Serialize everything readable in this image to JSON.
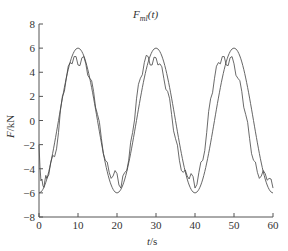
{
  "chart_data": {
    "type": "line",
    "title_main": "F",
    "title_sub": "ml",
    "title_arg": "(t)",
    "xlabel": "t/s",
    "xlabel_var": "t",
    "xlabel_unit": "/s",
    "ylabel": "F/kN",
    "ylabel_var": "F",
    "ylabel_unit": "/kN",
    "xlim": [
      0,
      60
    ],
    "ylim": [
      -8,
      8
    ],
    "xticks": [
      0,
      10,
      20,
      30,
      40,
      50,
      60
    ],
    "yticks": [
      -8,
      -6,
      -4,
      -2,
      0,
      2,
      4,
      6,
      8
    ],
    "grid": false,
    "legend": "none",
    "series": [
      {
        "name": "theoretical (smooth sine)",
        "amplitude": 6,
        "period": 20,
        "x": [
          0,
          2.5,
          5,
          7.5,
          10,
          12.5,
          15,
          17.5,
          20,
          22.5,
          25,
          27.5,
          30,
          32.5,
          35,
          37.5,
          40,
          42.5,
          45,
          47.5,
          50,
          52.5,
          55,
          57.5,
          60
        ],
        "values": [
          -6,
          -4.2,
          0,
          4.2,
          6,
          4.2,
          0,
          -4.2,
          -6,
          -4.2,
          0,
          4.2,
          6,
          4.2,
          0,
          -4.2,
          -6,
          -4.2,
          0,
          4.2,
          6,
          4.2,
          0,
          -4.2,
          -6
        ]
      },
      {
        "name": "measured (noisy)",
        "x": [
          0,
          0.5,
          1,
          1.5,
          2,
          3,
          4,
          5,
          6,
          7,
          8,
          9,
          10,
          11,
          12,
          13,
          14,
          15,
          16,
          17,
          18,
          19,
          20,
          21,
          22,
          23,
          24,
          25,
          26,
          27,
          28,
          29,
          30,
          31,
          32,
          33,
          34,
          35,
          36,
          37,
          38,
          39,
          40,
          41,
          42,
          43,
          44,
          45,
          46,
          47,
          48,
          49,
          50,
          51,
          52,
          53,
          54,
          55,
          56,
          57,
          58,
          59,
          60
        ],
        "values": [
          -2,
          -5,
          -5.4,
          -5.0,
          -4.8,
          -3.5,
          -3.0,
          -1.0,
          2.0,
          3.5,
          4.8,
          5.3,
          4.6,
          5.2,
          4.7,
          3.5,
          2.4,
          0.5,
          -1.5,
          -3.3,
          -4.3,
          -4.6,
          -4.4,
          -5.6,
          -4.3,
          -3.3,
          -1.0,
          1.8,
          3.5,
          4.8,
          5.3,
          4.6,
          5.2,
          4.7,
          3.5,
          2.4,
          0.5,
          -1.5,
          -3.3,
          -4.3,
          -4.6,
          -4.4,
          -5.6,
          -4.3,
          -3.3,
          -1.0,
          1.8,
          3.5,
          4.8,
          5.3,
          4.6,
          5.2,
          4.7,
          3.5,
          2.4,
          0.5,
          -1.5,
          -3.3,
          -4.3,
          -4.6,
          -4.4,
          -4.8,
          -5.6
        ]
      }
    ],
    "line_color": "#555555",
    "axis_color": "#555555"
  }
}
